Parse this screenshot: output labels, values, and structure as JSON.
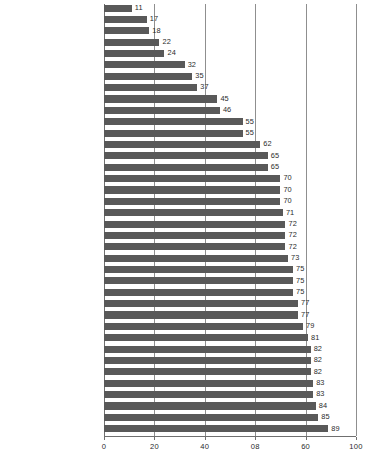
{
  "chart_data": {
    "type": "bar",
    "orientation": "horizontal",
    "title": "",
    "subtitle": "",
    "xlabel": "",
    "ylabel": "",
    "xlim": [
      0,
      100
    ],
    "grid": true,
    "legend": null,
    "legend_position": "none",
    "bar_color": "#595959",
    "gridline_color": "#8f8f8f",
    "axis_color": "#6f6f6f",
    "value_label_color": "#2b2b2b",
    "category_label_color": "#1a1a1a",
    "sort_order": "ascending",
    "xticks": [
      0,
      20,
      40,
      60,
      80,
      100
    ],
    "xticklabels": [
      "0",
      "20",
      "40",
      "08",
      "60",
      "100"
    ],
    "categories": [
      "Serbia",
      "Hungary",
      "China",
      "Russia",
      "Czech Republic",
      "Indonesia",
      "South Korea",
      "UAE",
      "Japan",
      "India",
      "Kuwait",
      "Nigeria",
      "Nepal",
      "Germany",
      "Pakistan",
      "Finland",
      "Greece",
      "Curaçao",
      "Poland",
      "Singapore",
      "Burkina Faso",
      "Philippines",
      "Ethiopia",
      "Italy",
      "Malaysia",
      "Germany",
      "Norway",
      "Canada",
      "Austria",
      "France",
      "Hong Kong",
      "Australia",
      "UK",
      "Netherlands",
      "Switzerland",
      "Denmark",
      "USA",
      "Sweden"
    ],
    "values": [
      11,
      17,
      18,
      22,
      24,
      32,
      35,
      37,
      45,
      46,
      55,
      55,
      62,
      65,
      65,
      70,
      70,
      70,
      71,
      72,
      72,
      72,
      73,
      75,
      75,
      75,
      77,
      77,
      79,
      81,
      82,
      82,
      82,
      83,
      83,
      84,
      85,
      89
    ],
    "data_labels": [
      "11",
      "17",
      "18",
      "22",
      "24",
      "32",
      "35",
      "37",
      "45",
      "46",
      "55",
      "55",
      "62",
      "65",
      "65",
      "70",
      "70",
      "70",
      "71",
      "72",
      "72",
      "72",
      "73",
      "75",
      "75",
      "75",
      "77",
      "77",
      "79",
      "81",
      "82",
      "82",
      "82",
      "83",
      "83",
      "84",
      "85",
      "89"
    ]
  }
}
